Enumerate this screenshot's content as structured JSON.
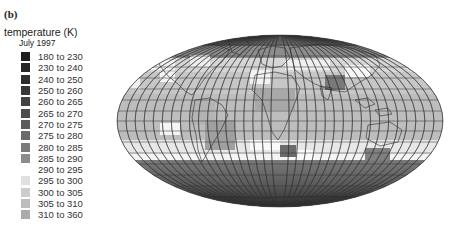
{
  "panel_label": "(b)",
  "legend": {
    "title": "temperature (K)",
    "subtitle": "July 1997",
    "items": [
      {
        "label": "180 to 230",
        "color": "#1e1e1e"
      },
      {
        "label": "230 to 240",
        "color": "#262626"
      },
      {
        "label": "240 to 250",
        "color": "#2e2e2e"
      },
      {
        "label": "250 to 260",
        "color": "#383838"
      },
      {
        "label": "260 to 265",
        "color": "#424242"
      },
      {
        "label": "265 to 270",
        "color": "#4d4d4d"
      },
      {
        "label": "270 to 275",
        "color": "#5c5c5c"
      },
      {
        "label": "275 to 280",
        "color": "#6b6b6b"
      },
      {
        "label": "280 to 285",
        "color": "#7a7a7a"
      },
      {
        "label": "285 to 290",
        "color": "#8c8c8c"
      },
      {
        "label": "290 to 295",
        "color": "#ffffff"
      },
      {
        "label": "295 to 300",
        "color": "#e0e0e0"
      },
      {
        "label": "300 to 305",
        "color": "#cccccc"
      },
      {
        "label": "305 to 310",
        "color": "#bdbdbd"
      },
      {
        "label": "310 to 360",
        "color": "#ababab"
      }
    ]
  },
  "map": {
    "projection": "equal-area ellipse (world)",
    "grid": "meridians and parallels at 10°",
    "description": "Global surface temperature, July 1997"
  }
}
